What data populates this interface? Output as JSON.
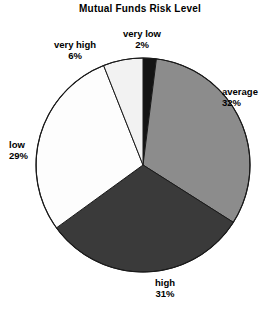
{
  "chart_data": {
    "type": "pie",
    "title": "Mutual Funds Risk Level",
    "xlabel": "",
    "ylabel": "",
    "legend_position": "none",
    "grid": false,
    "labels_outside": true,
    "start_angle_deg": 0,
    "direction": "clockwise",
    "categories": [
      "very low",
      "average",
      "high",
      "low",
      "very high"
    ],
    "values": [
      2,
      32,
      31,
      29,
      6
    ],
    "value_unit": "%",
    "slices": [
      {
        "label": "very low",
        "percent": 2,
        "percent_text": "2%",
        "color": "#141414"
      },
      {
        "label": "average",
        "percent": 32,
        "percent_text": "32%",
        "color": "#8c8c8c"
      },
      {
        "label": "high",
        "percent": 31,
        "percent_text": "31%",
        "color": "#3a3a3a"
      },
      {
        "label": "low",
        "percent": 29,
        "percent_text": "29%",
        "color": "#fdfdfd"
      },
      {
        "label": "very high",
        "percent": 6,
        "percent_text": "6%",
        "color": "#f2f2f2"
      }
    ],
    "outline_color": "#1a1a1a"
  },
  "labels": {
    "very_high": {
      "name": "very high",
      "pct": "6%"
    },
    "very_low": {
      "name": "very low",
      "pct": "2%"
    },
    "average": {
      "name": "average",
      "pct": "32%"
    },
    "low": {
      "name": "low",
      "pct": "29%"
    },
    "high": {
      "name": "high",
      "pct": "31%"
    }
  }
}
